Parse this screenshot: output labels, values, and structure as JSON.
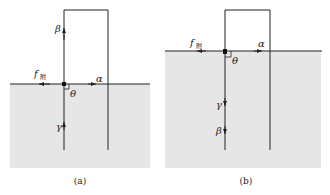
{
  "figure": {
    "panels": [
      {
        "id": "a",
        "caption": "(a)",
        "labels": {
          "beta": "β",
          "f": "f",
          "f_sub": "附",
          "alpha": "α",
          "theta": "θ",
          "gamma": "γ"
        }
      },
      {
        "id": "b",
        "caption": "(b)",
        "labels": {
          "beta": "β",
          "f": "f",
          "f_sub": "附",
          "alpha": "α",
          "theta": "θ",
          "gamma": "γ"
        }
      }
    ],
    "colors": {
      "liquid": "#e6e6e6",
      "line": "#222222",
      "background": "#ffffff"
    }
  }
}
